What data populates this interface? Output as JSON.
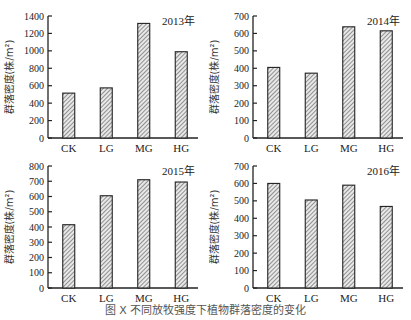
{
  "caption": "图 X  不同放牧强度下植物群落密度的变化",
  "chart_data": [
    {
      "type": "bar",
      "title": "2013年",
      "categories": [
        "CK",
        "LG",
        "MG",
        "HG"
      ],
      "values": [
        515,
        575,
        1315,
        990
      ],
      "xlabel": "",
      "ylabel": "群落密度(株/m²)",
      "ylim": [
        0,
        1400
      ],
      "yticks": [
        0,
        200,
        400,
        600,
        800,
        1000,
        1200,
        1400
      ],
      "grid": false,
      "bar_pattern": "diagonal-hatch"
    },
    {
      "type": "bar",
      "title": "2014年",
      "categories": [
        "CK",
        "LG",
        "MG",
        "HG"
      ],
      "values": [
        405,
        372,
        638,
        615
      ],
      "xlabel": "",
      "ylabel": "群落密度(株/m²)",
      "ylim": [
        0,
        700
      ],
      "yticks": [
        0,
        100,
        200,
        300,
        400,
        500,
        600,
        700
      ],
      "grid": false,
      "bar_pattern": "diagonal-hatch"
    },
    {
      "type": "bar",
      "title": "2015年",
      "categories": [
        "CK",
        "LG",
        "MG",
        "HG"
      ],
      "values": [
        415,
        605,
        710,
        695
      ],
      "xlabel": "",
      "ylabel": "群落密度(株/m²)",
      "ylim": [
        0,
        800
      ],
      "yticks": [
        0,
        100,
        200,
        300,
        400,
        500,
        600,
        700,
        800
      ],
      "grid": false,
      "bar_pattern": "diagonal-hatch"
    },
    {
      "type": "bar",
      "title": "2016年",
      "categories": [
        "CK",
        "LG",
        "MG",
        "HG"
      ],
      "values": [
        600,
        505,
        590,
        468
      ],
      "xlabel": "",
      "ylabel": "群落密度(株/m²)",
      "ylim": [
        0,
        700
      ],
      "yticks": [
        0,
        100,
        200,
        300,
        400,
        500,
        600,
        700
      ],
      "grid": false,
      "bar_pattern": "diagonal-hatch"
    }
  ]
}
